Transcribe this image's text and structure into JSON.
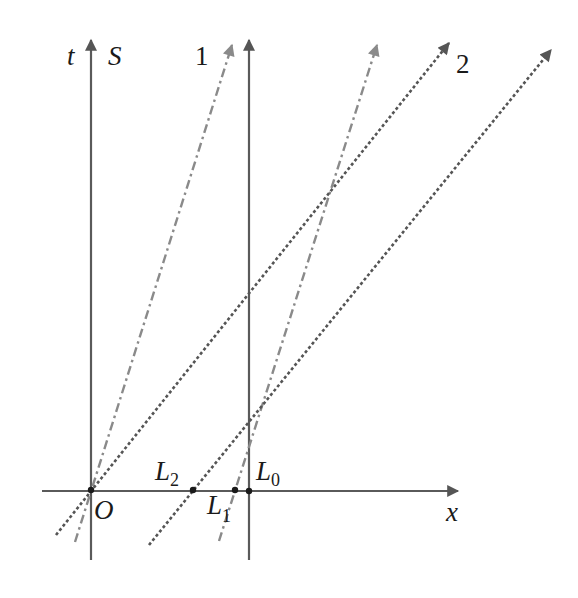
{
  "diagram": {
    "colors": {
      "axis": "#5a5a5a",
      "dotted_line": "#555555",
      "dashdot_line": "#8a8a8a",
      "point": "#1a1a1a",
      "text": "#1a1a1a"
    },
    "labels": {
      "t_axis": "t",
      "frame": "S",
      "x_axis": "x",
      "origin": "O",
      "line1": "1",
      "line2": "2",
      "L0_main": "L",
      "L0_sub": "0",
      "L1_main": "L",
      "L1_sub": "1",
      "L2_main": "L",
      "L2_sub": "2"
    },
    "axes": [
      {
        "name": "t-axis",
        "x1": 91,
        "y1": 560,
        "x2": 91,
        "y2": 40,
        "arrow": true
      },
      {
        "name": "x-axis",
        "x1": 42,
        "y1": 491,
        "x2": 458,
        "y2": 491,
        "arrow": true
      },
      {
        "name": "vertical-line-L0",
        "x1": 249,
        "y1": 560,
        "x2": 249,
        "y2": 40,
        "arrow": true
      }
    ],
    "lines": [
      {
        "name": "worldline-1-from-O",
        "style": "dashdot",
        "x1": 75,
        "y1": 542,
        "x2": 232,
        "y2": 45
      },
      {
        "name": "worldline-1-from-L1",
        "style": "dashdot",
        "x1": 219,
        "y1": 541,
        "x2": 377,
        "y2": 45
      },
      {
        "name": "worldline-2-from-O",
        "style": "dotted",
        "x1": 56,
        "y1": 535,
        "x2": 449,
        "y2": 43
      },
      {
        "name": "worldline-2-from-L2",
        "style": "dotted",
        "x1": 149,
        "y1": 545,
        "x2": 551,
        "y2": 50
      }
    ],
    "points": [
      {
        "name": "point-O",
        "x": 91,
        "y": 490
      },
      {
        "name": "point-L2",
        "x": 193,
        "y": 490
      },
      {
        "name": "point-L1",
        "x": 235,
        "y": 490
      },
      {
        "name": "point-L0",
        "x": 249,
        "y": 491
      }
    ]
  }
}
